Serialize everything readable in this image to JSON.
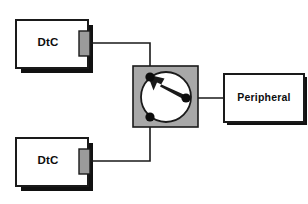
{
  "diagram": {
    "type": "block-diagram",
    "background_color": "#ffffff",
    "line_color": "#1a1a1a",
    "shadow_color": "#111111",
    "box_fill": "#ffffff",
    "switch_fill": "#a8a8a8",
    "connector_fill": "#9b9b9b",
    "circle_fill": "#ffffff"
  },
  "nodes": {
    "dtc_top": {
      "label": "DtC",
      "role": "data-terminal-device",
      "x": 16,
      "y": 20,
      "w": 72,
      "h": 48
    },
    "dtc_bottom": {
      "label": "DtC",
      "role": "data-terminal-device",
      "x": 16,
      "y": 138,
      "w": 72,
      "h": 48
    },
    "peripheral": {
      "label": "Peripheral",
      "role": "peripheral-device",
      "x": 224,
      "y": 74,
      "w": 80,
      "h": 48
    },
    "switch": {
      "label": "",
      "role": "manual-switch",
      "x": 133,
      "y": 66,
      "w": 65,
      "h": 61
    }
  },
  "switch_detail": {
    "circle_cx": 166,
    "circle_cy": 97,
    "circle_r": 25,
    "terminals": [
      {
        "name": "terminal-upper-left",
        "cx": 150,
        "cy": 77,
        "r": 4.5,
        "connected": true
      },
      {
        "name": "terminal-lower-left",
        "cx": 150,
        "cy": 117,
        "r": 4.5,
        "connected": false
      },
      {
        "name": "pivot-right",
        "cx": 186,
        "cy": 98,
        "r": 4.5,
        "connected": true
      }
    ],
    "pointer": {
      "from_x": 186,
      "from_y": 98,
      "to_x": 153,
      "to_y": 79,
      "description": "arrow from pivot to upper-left terminal"
    }
  },
  "connectors": [
    {
      "name": "dtc-top-port",
      "x": 80,
      "y": 31,
      "w": 10,
      "h": 24
    },
    {
      "name": "dtc-bottom-port",
      "x": 80,
      "y": 149,
      "w": 10,
      "h": 24
    }
  ],
  "wires": [
    {
      "name": "wire-dtc-top-to-switch",
      "path": "M 90 43 L 150 43 L 150 77",
      "from": "dtc_top",
      "to": "terminal-upper-left"
    },
    {
      "name": "wire-dtc-bottom-to-switch",
      "path": "M 90 161 L 150 161 L 150 117",
      "from": "dtc_bottom",
      "to": "terminal-lower-left"
    },
    {
      "name": "wire-switch-to-peripheral",
      "path": "M 186 98 L 224 98",
      "from": "pivot-right",
      "to": "peripheral"
    }
  ]
}
